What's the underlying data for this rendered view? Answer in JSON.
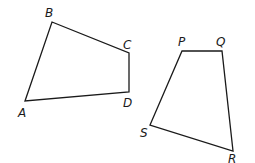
{
  "diagram": {
    "type": "two-quadrilaterals",
    "stroke_color": "#1a1a1a",
    "background": "#ffffff",
    "shapes": [
      {
        "name": "ABCD",
        "vertices": [
          {
            "label": "A",
            "x": 25,
            "y": 101,
            "lx": 18,
            "ly": 117
          },
          {
            "label": "B",
            "x": 52,
            "y": 22,
            "lx": 45,
            "ly": 17
          },
          {
            "label": "C",
            "x": 129,
            "y": 53,
            "lx": 123,
            "ly": 49
          },
          {
            "label": "D",
            "x": 129,
            "y": 92,
            "lx": 123,
            "ly": 107
          }
        ]
      },
      {
        "name": "PQRS",
        "vertices": [
          {
            "label": "P",
            "x": 182,
            "y": 51,
            "lx": 178,
            "ly": 46
          },
          {
            "label": "Q",
            "x": 222,
            "y": 51,
            "lx": 216,
            "ly": 46
          },
          {
            "label": "R",
            "x": 233,
            "y": 151,
            "lx": 228,
            "ly": 163
          },
          {
            "label": "S",
            "x": 150,
            "y": 125,
            "lx": 140,
            "ly": 137
          }
        ]
      }
    ]
  }
}
